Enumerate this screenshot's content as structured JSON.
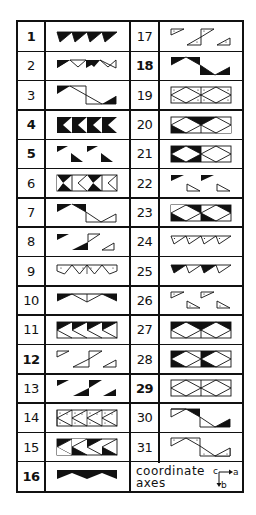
{
  "diagram": {
    "rows": 16,
    "left_column": [
      {
        "number": "1",
        "bold": true,
        "glyph": "p1"
      },
      {
        "number": "2",
        "bold": false,
        "glyph": "p2"
      },
      {
        "number": "3",
        "bold": false,
        "glyph": "p3"
      },
      {
        "number": "4",
        "bold": true,
        "glyph": "p4"
      },
      {
        "number": "5",
        "bold": true,
        "glyph": "p5"
      },
      {
        "number": "6",
        "bold": false,
        "glyph": "p6"
      },
      {
        "number": "7",
        "bold": false,
        "glyph": "p7"
      },
      {
        "number": "8",
        "bold": false,
        "glyph": "p8"
      },
      {
        "number": "9",
        "bold": false,
        "glyph": "p9"
      },
      {
        "number": "10",
        "bold": false,
        "glyph": "p10"
      },
      {
        "number": "11",
        "bold": false,
        "glyph": "p11"
      },
      {
        "number": "12",
        "bold": true,
        "glyph": "p12"
      },
      {
        "number": "13",
        "bold": false,
        "glyph": "p13"
      },
      {
        "number": "14",
        "bold": false,
        "glyph": "p14"
      },
      {
        "number": "15",
        "bold": false,
        "glyph": "p15"
      },
      {
        "number": "16",
        "bold": true,
        "glyph": "p16"
      }
    ],
    "right_column": [
      {
        "number": "17",
        "bold": false,
        "glyph": "p17"
      },
      {
        "number": "18",
        "bold": true,
        "glyph": "p18"
      },
      {
        "number": "19",
        "bold": false,
        "glyph": "p19"
      },
      {
        "number": "20",
        "bold": false,
        "glyph": "p20"
      },
      {
        "number": "21",
        "bold": false,
        "glyph": "p21"
      },
      {
        "number": "22",
        "bold": false,
        "glyph": "p22"
      },
      {
        "number": "23",
        "bold": false,
        "glyph": "p23"
      },
      {
        "number": "24",
        "bold": false,
        "glyph": "p24"
      },
      {
        "number": "25",
        "bold": false,
        "glyph": "p25"
      },
      {
        "number": "26",
        "bold": false,
        "glyph": "p26"
      },
      {
        "number": "27",
        "bold": false,
        "glyph": "p27"
      },
      {
        "number": "28",
        "bold": false,
        "glyph": "p28"
      },
      {
        "number": "29",
        "bold": true,
        "glyph": "p29"
      },
      {
        "number": "30",
        "bold": false,
        "glyph": "p30"
      },
      {
        "number": "31",
        "bold": false,
        "glyph": "p31"
      }
    ],
    "legend": {
      "label_line1": "coordinate",
      "label_line2": "axes",
      "axis_c": "c",
      "axis_a": "a",
      "axis_b": "b"
    },
    "colors": {
      "ink": "#111111",
      "paper": "#ffffff"
    }
  }
}
